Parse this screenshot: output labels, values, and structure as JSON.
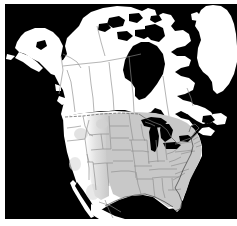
{
  "figure": {
    "type": "thematic-range-map",
    "region": "North America",
    "projection": "conic",
    "width": 237,
    "height": 226,
    "caption": ""
  },
  "colors": {
    "ocean": "#000000",
    "land": "#ffffff",
    "border_line": "#8c8c8c",
    "coast_line": "#000000",
    "shaded_range": "#c8c8c8",
    "shaded_range_soft": "#d8d8d8",
    "lake": "#000000",
    "page_background": "#ffffff"
  },
  "legend": {
    "visible": false,
    "entries": [
      {
        "label": "Range / distribution",
        "swatch": "#c8c8c8"
      },
      {
        "label": "Outside range",
        "swatch": "#ffffff"
      },
      {
        "label": "Water",
        "swatch": "#000000"
      }
    ]
  },
  "layers": [
    {
      "name": "ocean-background",
      "label": "Ocean",
      "fill": "#000000"
    },
    {
      "name": "landmass",
      "label": "Land",
      "fill": "#ffffff"
    },
    {
      "name": "shaded-range",
      "label": "Shaded distribution area",
      "fill": "#c8c8c8"
    },
    {
      "name": "political-borders",
      "label": "State and province boundaries",
      "stroke": "#8c8c8c"
    },
    {
      "name": "great-lakes",
      "label": "Great Lakes",
      "fill": "#000000"
    },
    {
      "name": "hudson-bay",
      "label": "Hudson Bay",
      "fill": "#000000"
    }
  ],
  "features": {
    "countries": [
      "Canada",
      "United States",
      "Mexico",
      "Greenland"
    ],
    "water_bodies": [
      "Pacific Ocean",
      "Atlantic Ocean",
      "Gulf of Mexico",
      "Hudson Bay",
      "Great Lakes",
      "Gulf of California",
      "Baffin Bay"
    ],
    "landforms": [
      "Alaska",
      "Aleutian Islands",
      "Canadian Arctic Archipelago",
      "Baffin Island",
      "Labrador",
      "Newfoundland",
      "Nova Scotia",
      "Florida Peninsula",
      "Baja California"
    ]
  },
  "shaded_region": {
    "description": "Central and eastern United States",
    "coverage": "Great Plains eastward to the Atlantic coast, Great Lakes south to the Gulf Coast and Florida"
  },
  "annotations": []
}
